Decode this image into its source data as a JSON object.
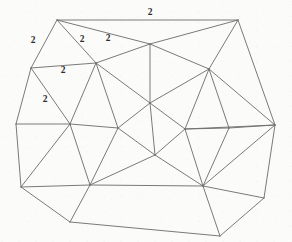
{
  "figure": {
    "kind": "planar-triangulated-graph-drawing",
    "background_color": "#fbfbfa",
    "line_color": "#6b6b6b",
    "label_color": "#2c2c2c",
    "width": 292,
    "height": 242
  },
  "chart_data": {
    "type": "diagram",
    "title": "",
    "xlabel": "",
    "ylabel": "",
    "vertices": [
      {
        "id": "v1",
        "name": "top-left-corner",
        "x": 57,
        "y": 20
      },
      {
        "id": "v2",
        "name": "top-right-corner",
        "x": 238,
        "y": 20
      },
      {
        "id": "v3",
        "name": "left-upper",
        "x": 31,
        "y": 68
      },
      {
        "id": "v4",
        "name": "upper-hub",
        "x": 96,
        "y": 63
      },
      {
        "id": "v5",
        "name": "top-mid-fan",
        "x": 150,
        "y": 44
      },
      {
        "id": "v6",
        "name": "right-upper-hub",
        "x": 209,
        "y": 69
      },
      {
        "id": "v7",
        "name": "center-upper",
        "x": 150,
        "y": 103
      },
      {
        "id": "v8",
        "name": "left-mid",
        "x": 16,
        "y": 124
      },
      {
        "id": "v9",
        "name": "left-center-hub",
        "x": 70,
        "y": 124
      },
      {
        "id": "v10",
        "name": "center-left",
        "x": 118,
        "y": 128
      },
      {
        "id": "v11",
        "name": "center-right",
        "x": 185,
        "y": 129
      },
      {
        "id": "v12",
        "name": "diamond-mid",
        "x": 229,
        "y": 128
      },
      {
        "id": "v13",
        "name": "right-corner",
        "x": 275,
        "y": 125
      },
      {
        "id": "v14",
        "name": "center-lower",
        "x": 155,
        "y": 155
      },
      {
        "id": "v15",
        "name": "bottom-left-corner",
        "x": 21,
        "y": 187
      },
      {
        "id": "v16",
        "name": "bottom-left-hub",
        "x": 90,
        "y": 185
      },
      {
        "id": "v17",
        "name": "bottom-right-hub",
        "x": 203,
        "y": 186
      },
      {
        "id": "v18",
        "name": "bottom-mid-corner",
        "x": 70,
        "y": 222
      },
      {
        "id": "v19",
        "name": "bottom-right-corner",
        "x": 220,
        "y": 236
      },
      {
        "id": "v20",
        "name": "right-lower-corner",
        "x": 264,
        "y": 198
      }
    ],
    "edges": [
      [
        "v1",
        "v2"
      ],
      [
        "v1",
        "v3"
      ],
      [
        "v1",
        "v4"
      ],
      [
        "v1",
        "v5"
      ],
      [
        "v2",
        "v5"
      ],
      [
        "v2",
        "v6"
      ],
      [
        "v2",
        "v13"
      ],
      [
        "v3",
        "v4"
      ],
      [
        "v3",
        "v8"
      ],
      [
        "v3",
        "v9"
      ],
      [
        "v4",
        "v5"
      ],
      [
        "v4",
        "v7"
      ],
      [
        "v4",
        "v9"
      ],
      [
        "v4",
        "v10"
      ],
      [
        "v5",
        "v6"
      ],
      [
        "v5",
        "v7"
      ],
      [
        "v6",
        "v7"
      ],
      [
        "v6",
        "v11"
      ],
      [
        "v6",
        "v12"
      ],
      [
        "v6",
        "v13"
      ],
      [
        "v7",
        "v10"
      ],
      [
        "v7",
        "v11"
      ],
      [
        "v7",
        "v14"
      ],
      [
        "v8",
        "v9"
      ],
      [
        "v8",
        "v15"
      ],
      [
        "v9",
        "v10"
      ],
      [
        "v9",
        "v15"
      ],
      [
        "v9",
        "v16"
      ],
      [
        "v10",
        "v14"
      ],
      [
        "v10",
        "v16"
      ],
      [
        "v11",
        "v12"
      ],
      [
        "v11",
        "v13"
      ],
      [
        "v11",
        "v14"
      ],
      [
        "v11",
        "v17"
      ],
      [
        "v12",
        "v13"
      ],
      [
        "v12",
        "v17"
      ],
      [
        "v13",
        "v17"
      ],
      [
        "v13",
        "v20"
      ],
      [
        "v14",
        "v16"
      ],
      [
        "v14",
        "v17"
      ],
      [
        "v15",
        "v16"
      ],
      [
        "v15",
        "v18"
      ],
      [
        "v16",
        "v18"
      ],
      [
        "v16",
        "v17"
      ],
      [
        "v17",
        "v19"
      ],
      [
        "v17",
        "v20"
      ],
      [
        "v18",
        "v19"
      ],
      [
        "v19",
        "v20"
      ]
    ],
    "edge_labels": [
      {
        "id": "l1",
        "text": "2",
        "x": 150,
        "y": 13,
        "for_edge": [
          "v1",
          "v2"
        ]
      },
      {
        "id": "l2",
        "text": "2",
        "x": 33,
        "y": 41,
        "for_edge": [
          "v1",
          "v3"
        ]
      },
      {
        "id": "l3",
        "text": "2",
        "x": 82,
        "y": 40,
        "for_edge": [
          "v1",
          "v4"
        ]
      },
      {
        "id": "l4",
        "text": "2",
        "x": 108,
        "y": 39,
        "for_edge": [
          "v1",
          "v5"
        ]
      },
      {
        "id": "l5",
        "text": "2",
        "x": 63,
        "y": 71,
        "for_edge": [
          "v3",
          "v4"
        ]
      },
      {
        "id": "l6",
        "text": "2",
        "x": 45,
        "y": 100,
        "for_edge": [
          "v3",
          "v9"
        ]
      }
    ],
    "legend": [],
    "grid": false
  }
}
